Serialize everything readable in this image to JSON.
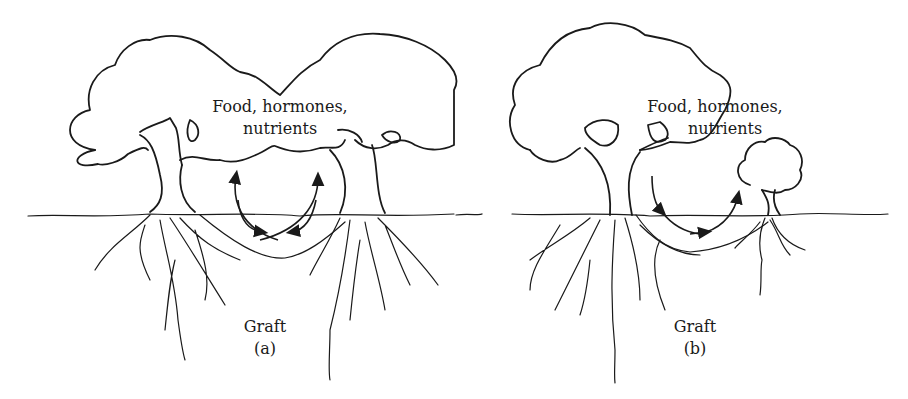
{
  "figure": {
    "panels": [
      {
        "id": "a",
        "flow_label_line1": "Food, hormones,",
        "flow_label_line2": "nutrients",
        "graft_label": "Graft",
        "panel_label": "(a)"
      },
      {
        "id": "b",
        "flow_label_line1": "Food, hormones,",
        "flow_label_line2": "nutrients",
        "graft_label": "Graft",
        "panel_label": "(b)"
      }
    ]
  }
}
